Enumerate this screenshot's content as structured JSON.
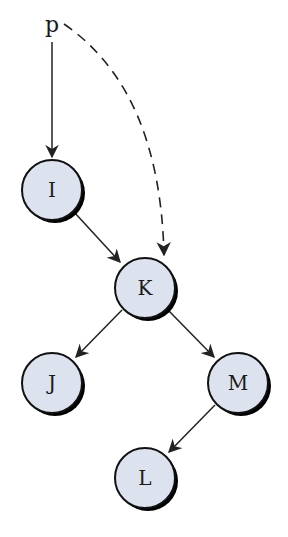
{
  "diagram": {
    "type": "binary-tree-pointer",
    "pointer": {
      "label": "p",
      "x": 52,
      "y": 30
    },
    "colors": {
      "node_fill": "#dde3ee",
      "node_stroke": "#111111",
      "shadow": "#000000",
      "edge": "#222222",
      "background": "#ffffff"
    },
    "nodes": [
      {
        "id": "I",
        "label": "I",
        "cx": 52,
        "cy": 190
      },
      {
        "id": "K",
        "label": "K",
        "cx": 145,
        "cy": 288
      },
      {
        "id": "J",
        "label": "J",
        "cx": 52,
        "cy": 383
      },
      {
        "id": "M",
        "label": "M",
        "cx": 238,
        "cy": 383
      },
      {
        "id": "L",
        "label": "L",
        "cx": 145,
        "cy": 478
      }
    ],
    "edges": [
      {
        "from": "p",
        "to": "I",
        "style": "solid"
      },
      {
        "from": "p",
        "to": "K",
        "style": "dashed"
      },
      {
        "from": "I",
        "to": "K",
        "style": "solid"
      },
      {
        "from": "K",
        "to": "J",
        "style": "solid"
      },
      {
        "from": "K",
        "to": "M",
        "style": "solid"
      },
      {
        "from": "M",
        "to": "L",
        "style": "solid"
      }
    ]
  }
}
